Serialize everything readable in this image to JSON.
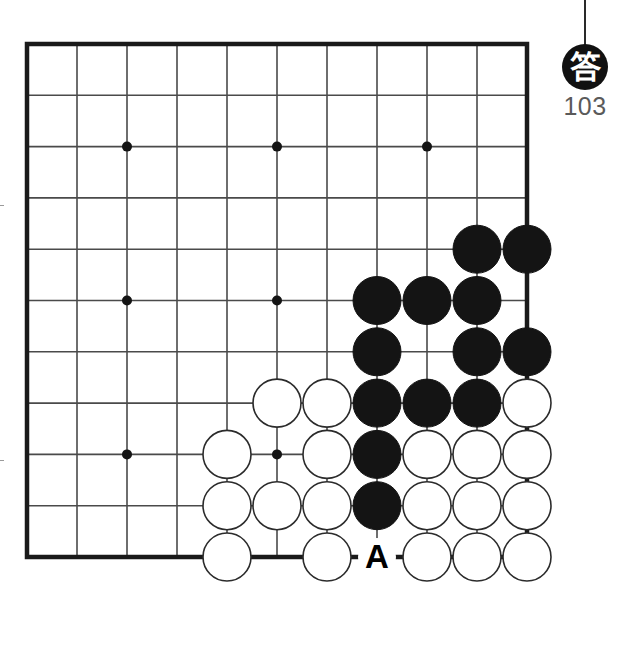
{
  "diagram": {
    "kind": "go-board-problem",
    "badge": {
      "label": "答",
      "number": "103"
    },
    "board": {
      "columns": 11,
      "rows": 11,
      "origin_x": 27,
      "origin_y": 44,
      "spacing_x": 50,
      "spacing_y": 51.3,
      "stone_radius": 24,
      "line_color": "#4a4a4a",
      "border_color": "#1a1a1a",
      "background": "#ffffff",
      "star_points": [
        {
          "col": 2,
          "row": 2
        },
        {
          "col": 5,
          "row": 2
        },
        {
          "col": 8,
          "row": 2
        },
        {
          "col": 2,
          "row": 5
        },
        {
          "col": 5,
          "row": 5
        },
        {
          "col": 2,
          "row": 8
        },
        {
          "col": 5,
          "row": 8
        }
      ],
      "black_stones": [
        {
          "col": 9,
          "row": 4
        },
        {
          "col": 10,
          "row": 4
        },
        {
          "col": 7,
          "row": 5
        },
        {
          "col": 8,
          "row": 5
        },
        {
          "col": 9,
          "row": 5
        },
        {
          "col": 7,
          "row": 6
        },
        {
          "col": 9,
          "row": 6
        },
        {
          "col": 10,
          "row": 6
        },
        {
          "col": 7,
          "row": 7
        },
        {
          "col": 8,
          "row": 7
        },
        {
          "col": 9,
          "row": 7
        },
        {
          "col": 7,
          "row": 8
        },
        {
          "col": 7,
          "row": 9
        }
      ],
      "white_stones": [
        {
          "col": 5,
          "row": 7
        },
        {
          "col": 6,
          "row": 7
        },
        {
          "col": 10,
          "row": 7
        },
        {
          "col": 4,
          "row": 8
        },
        {
          "col": 6,
          "row": 8
        },
        {
          "col": 8,
          "row": 8
        },
        {
          "col": 9,
          "row": 8
        },
        {
          "col": 10,
          "row": 8
        },
        {
          "col": 4,
          "row": 9
        },
        {
          "col": 5,
          "row": 9
        },
        {
          "col": 6,
          "row": 9
        },
        {
          "col": 8,
          "row": 9
        },
        {
          "col": 9,
          "row": 9
        },
        {
          "col": 10,
          "row": 9
        },
        {
          "col": 4,
          "row": 10
        },
        {
          "col": 6,
          "row": 10
        },
        {
          "col": 8,
          "row": 10
        },
        {
          "col": 9,
          "row": 10
        },
        {
          "col": 10,
          "row": 10
        }
      ],
      "markers": [
        {
          "col": 7,
          "row": 10,
          "label": "A",
          "color": "#000000"
        }
      ],
      "black_color": "#141414",
      "white_color": "#ffffff",
      "white_outline": "#2b2b2b"
    }
  }
}
